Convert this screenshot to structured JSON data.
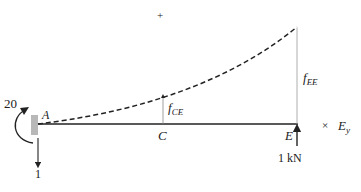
{
  "diagram": {
    "type": "cantilever-beam-deflection",
    "points": {
      "A": "A",
      "C": "C",
      "E": "E"
    },
    "labels": {
      "moment_value": "20",
      "reaction_value": "1",
      "load": "1 kN",
      "f_ce_main": "f",
      "f_ce_sub": "CE",
      "f_ee_main": "f",
      "f_ee_sub": "EE",
      "plus_marker": "+",
      "times_marker": "×",
      "ey_main": "E",
      "ey_sub": "y"
    },
    "colors": {
      "line": "#222222",
      "wall": "#b8b8b8",
      "guide": "#888888"
    }
  }
}
